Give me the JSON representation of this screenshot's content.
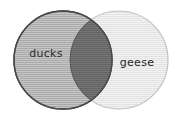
{
  "figure": {
    "type": "venn-diagram",
    "title": "",
    "background_color": "#ffffff",
    "sets": [
      {
        "id": "left",
        "label": "ducks",
        "fill_color": "#b9b9b9",
        "stroke_color": "#4a4a4a",
        "pattern": "horizontal-hatch",
        "center_x": 63,
        "center_y": 60,
        "radius": 49
      },
      {
        "id": "right",
        "label": "geese",
        "fill_color": "#ededed",
        "stroke_color": "#c2c2c2",
        "pattern": "horizontal-hatch",
        "center_x": 119,
        "center_y": 60,
        "radius": 49
      }
    ],
    "intersection": {
      "label": "",
      "fill_color": "#6b6b6b",
      "pattern": "horizontal-hatch"
    },
    "labels": {
      "left_label": "ducks",
      "right_label": "geese"
    }
  }
}
